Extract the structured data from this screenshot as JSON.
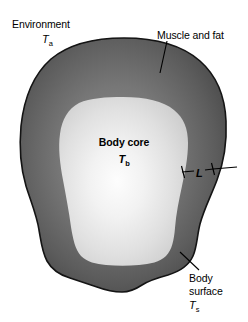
{
  "figure": {
    "type": "cross-section-diagram",
    "labels": {
      "environment": "Environment",
      "environment_symbol": "T",
      "environment_subscript": "a",
      "muscle_and_fat": "Muscle and fat",
      "body_core": "Body core",
      "body_core_symbol": "T",
      "body_core_subscript": "b",
      "thickness_symbol": "L",
      "body_surface_line1": "Body",
      "body_surface_line2": "surface",
      "body_surface_symbol": "T",
      "body_surface_subscript": "s"
    },
    "colors": {
      "background": "#ffffff",
      "outline": "#1a1a1a",
      "shell_outer": "#4e4e4e",
      "shell_inner": "#787878",
      "core_edge": "#c9c9c9",
      "core_center": "#fbfbfb",
      "leader_line": "#000000"
    }
  }
}
